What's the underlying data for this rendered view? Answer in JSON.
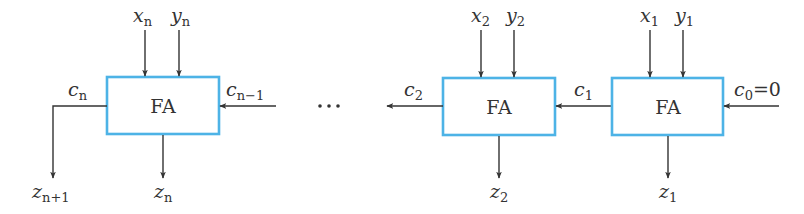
{
  "diagram": {
    "colors": {
      "box_stroke": "#4db3e6",
      "wire": "#333333"
    },
    "ellipsis": "…",
    "blocks": [
      {
        "id": "fa-n",
        "label": "FA",
        "inputs": [
          {
            "var": "x",
            "sub": "n"
          },
          {
            "var": "y",
            "sub": "n"
          }
        ],
        "carry_in": {
          "var": "c",
          "sub": "n−1"
        },
        "carry_out": {
          "var": "c",
          "sub": "n"
        },
        "sum": {
          "var": "z",
          "sub": "n"
        },
        "extra_out": {
          "var": "z",
          "sub": "n+1"
        }
      },
      {
        "id": "fa-2",
        "label": "FA",
        "inputs": [
          {
            "var": "x",
            "sub": "2"
          },
          {
            "var": "y",
            "sub": "2"
          }
        ],
        "carry_out": {
          "var": "c",
          "sub": "2"
        },
        "sum": {
          "var": "z",
          "sub": "2"
        }
      },
      {
        "id": "fa-1",
        "label": "FA",
        "inputs": [
          {
            "var": "x",
            "sub": "1"
          },
          {
            "var": "y",
            "sub": "1"
          }
        ],
        "carry_in": {
          "var": "c",
          "sub": "0",
          "value": "=0"
        },
        "carry_out": {
          "var": "c",
          "sub": "1"
        },
        "sum": {
          "var": "z",
          "sub": "1"
        }
      }
    ]
  }
}
